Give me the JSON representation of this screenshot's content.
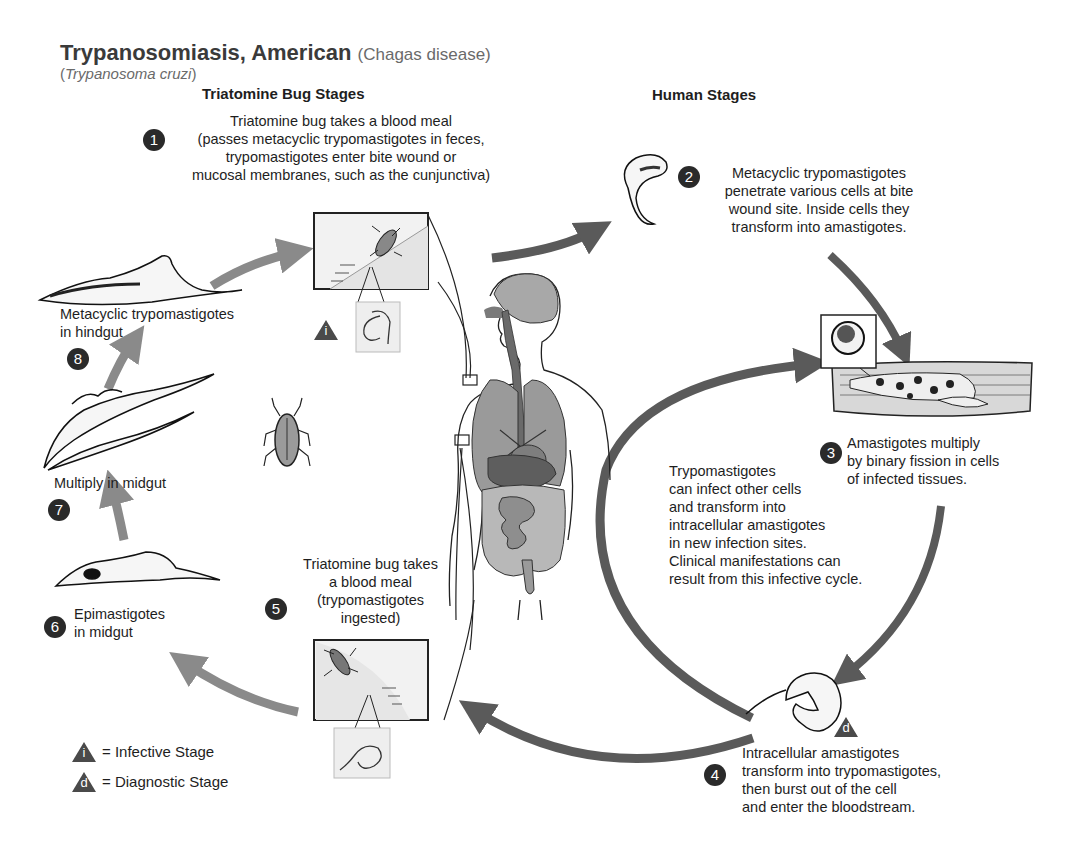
{
  "header": {
    "title": "Trypanosomiasis, American",
    "title_paren": "(Chagas disease)",
    "subtitle_open": "(",
    "subtitle_species": "Trypanosoma cruzi",
    "subtitle_close": ")"
  },
  "sections": {
    "bug": "Triatomine Bug Stages",
    "human": "Human Stages"
  },
  "steps": [
    {
      "num": "1",
      "lines": [
        "Triatomine bug takes a blood meal",
        "(passes metacyclic trypomastigotes in feces,",
        "trypomastigotes enter bite wound or",
        "mucosal membranes, such as the cunjunctiva)"
      ]
    },
    {
      "num": "2",
      "lines": [
        "Metacyclic trypomastigotes",
        "penetrate various cells at bite",
        "wound site. Inside cells they",
        "transform into amastigotes."
      ]
    },
    {
      "num": "3",
      "lines": [
        "Amastigotes multiply",
        "by binary fission in cells",
        "of infected tissues."
      ]
    },
    {
      "num": "4",
      "lines": [
        "Intracellular amastigotes",
        "transform into trypomastigotes,",
        "then burst out of the cell",
        "and enter the bloodstream."
      ]
    },
    {
      "num": "5",
      "lines": [
        "Triatomine bug takes",
        "a blood meal",
        "(trypomastigotes",
        "ingested)"
      ]
    },
    {
      "num": "6",
      "lines": [
        "Epimastigotes",
        "in midgut"
      ]
    },
    {
      "num": "7",
      "lines": [
        "Multiply in midgut"
      ]
    },
    {
      "num": "8",
      "lines": [
        "Metacyclic trypomastigotes",
        "in hindgut"
      ]
    }
  ],
  "cycle_note": {
    "lines": [
      "Trypomastigotes",
      "can infect other cells",
      "and transform into",
      "intracellular amastigotes",
      "in new infection sites.",
      "Clinical manifestations can",
      "result from this infective cycle."
    ]
  },
  "markers": {
    "infective_letter": "i",
    "diagnostic_letter": "d"
  },
  "legend": {
    "items": [
      {
        "letter": "i",
        "label": "= Infective Stage"
      },
      {
        "letter": "d",
        "label": "= Diagnostic Stage"
      }
    ]
  },
  "colors": {
    "arrow_bug": "#8a8a8a",
    "arrow_human": "#5a5a5a",
    "badge": "#2a2a2a",
    "organ_gray": "#9a9a9a",
    "organ_dark": "#5e5e5e",
    "box_fill": "#eeeeee"
  }
}
